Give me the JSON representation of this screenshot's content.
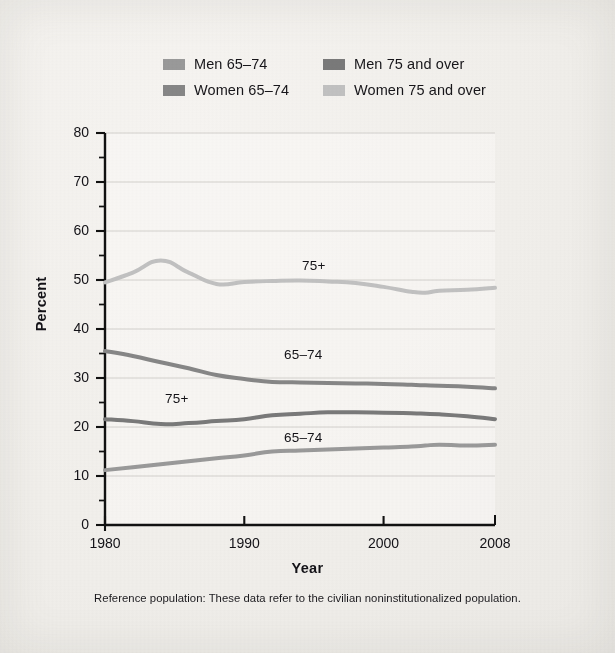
{
  "legend": {
    "items": [
      {
        "label": "Men 65–74",
        "color": "#9a9a9a",
        "key": "men65"
      },
      {
        "label": "Men 75 and over",
        "color": "#7a7a7a",
        "key": "men75"
      },
      {
        "label": "Women 65–74",
        "color": "#878787",
        "key": "women65"
      },
      {
        "label": "Women 75 and over",
        "color": "#c2c2c2",
        "key": "women75"
      }
    ]
  },
  "series_labels": {
    "women75": "75+",
    "women65": "65–74",
    "men75": "75+",
    "men65": "65–74"
  },
  "footnote": "Reference population: These data refer to the civilian noninstitutionalized population.",
  "chart_data": {
    "type": "line",
    "title": "",
    "xlabel": "Year",
    "ylabel": "Percent",
    "xlim": [
      1980,
      2008
    ],
    "ylim": [
      0,
      80
    ],
    "ytick_values": [
      0,
      10,
      20,
      30,
      40,
      50,
      60,
      70,
      80
    ],
    "ytick_labels": [
      "0",
      "10",
      "20",
      "30",
      "40",
      "50",
      "60",
      "70",
      "80"
    ],
    "yminor_step": 5,
    "xtick_values": [
      1980,
      1990,
      2000,
      2008
    ],
    "xtick_labels": [
      "1980",
      "1990",
      "2000",
      "2008"
    ],
    "grid": "horizontal",
    "legend_position": "above-plot",
    "x": [
      1980,
      1982,
      1984,
      1986,
      1988,
      1990,
      1992,
      1994,
      1996,
      1998,
      2000,
      2002,
      2003,
      2004,
      2006,
      2008
    ],
    "series": [
      {
        "name": "Women 75 and over",
        "color": "#c2c2c2",
        "inline_label": "75+",
        "values": [
          49.5,
          51.5,
          54.0,
          51.5,
          49.2,
          49.6,
          49.8,
          49.9,
          49.7,
          49.4,
          48.6,
          47.6,
          47.4,
          47.8,
          48.0,
          48.4
        ]
      },
      {
        "name": "Women 65–74",
        "color": "#878787",
        "inline_label": "65–74",
        "values": [
          35.5,
          34.5,
          33.2,
          32.0,
          30.6,
          29.8,
          29.2,
          29.1,
          29.0,
          28.9,
          28.8,
          28.6,
          28.5,
          28.4,
          28.2,
          27.9
        ]
      },
      {
        "name": "Men 75 and over",
        "color": "#7a7a7a",
        "inline_label": "75+",
        "values": [
          21.6,
          21.2,
          20.6,
          20.8,
          21.2,
          21.6,
          22.4,
          22.7,
          23.0,
          23.0,
          22.9,
          22.8,
          22.7,
          22.6,
          22.2,
          21.6
        ]
      },
      {
        "name": "Men 65–74",
        "color": "#9a9a9a",
        "inline_label": "65–74",
        "values": [
          11.2,
          11.8,
          12.4,
          13.0,
          13.6,
          14.2,
          15.0,
          15.2,
          15.4,
          15.6,
          15.8,
          16.0,
          16.2,
          16.4,
          16.2,
          16.4
        ]
      }
    ]
  }
}
